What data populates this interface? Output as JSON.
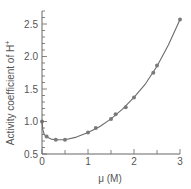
{
  "chart_data": {
    "type": "line",
    "title": "",
    "xlabel": "μ (M)",
    "ylabel": "Activity coefficient of H",
    "ylabel_superscript": "+",
    "xlim": [
      0,
      3
    ],
    "ylim": [
      0.5,
      2.7
    ],
    "x_ticks": [
      0,
      1,
      2,
      3
    ],
    "x_tick_labels": [
      "0",
      "1",
      "2",
      "3"
    ],
    "y_ticks": [
      0.5,
      1.0,
      1.5,
      2.0,
      2.5
    ],
    "y_tick_labels": [
      "0.5",
      "1.0",
      "1.5",
      "2.0",
      "2.5"
    ],
    "grid": false,
    "legend": null,
    "series": [
      {
        "name": "measured",
        "style": "markers",
        "x": [
          0,
          0.1,
          0.3,
          0.5,
          1.0,
          1.17,
          1.5,
          1.6,
          1.82,
          2.0,
          2.42,
          2.5,
          3.0
        ],
        "y": [
          1.0,
          0.77,
          0.72,
          0.72,
          0.83,
          0.9,
          1.04,
          1.11,
          1.22,
          1.37,
          1.75,
          1.86,
          2.57
        ]
      },
      {
        "name": "fit curve",
        "style": "line",
        "x": [
          0,
          0.02,
          0.05,
          0.1,
          0.2,
          0.3,
          0.5,
          0.75,
          1.0,
          1.25,
          1.5,
          1.75,
          2.0,
          2.25,
          2.5,
          2.75,
          3.0
        ],
        "y": [
          1.0,
          0.87,
          0.8,
          0.76,
          0.73,
          0.72,
          0.72,
          0.76,
          0.83,
          0.92,
          1.04,
          1.19,
          1.37,
          1.58,
          1.85,
          2.18,
          2.57
        ]
      }
    ]
  },
  "colors": {
    "line": "#6b6b6b",
    "marker": "#7a7a7a",
    "axis": "#666666",
    "text": "#555555"
  }
}
